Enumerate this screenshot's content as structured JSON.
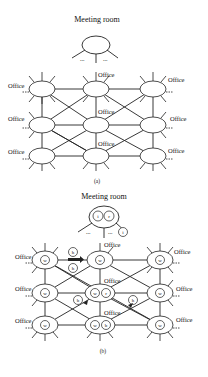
{
  "figure_a": {
    "meeting_room_label": "Meeting room",
    "office_label": "Office",
    "dots": "...",
    "caption": "(a)"
  },
  "figure_b": {
    "meeting_room_label": "Meeting room",
    "office_label": "Office",
    "dots": "...",
    "caption": "(b)",
    "meeting_tokens": [
      "i",
      "r"
    ],
    "meeting_outside_token": "i",
    "office_tokens": {
      "r0c0": [
        "w"
      ],
      "r0c1": [
        "w"
      ],
      "r0c2": [
        "w"
      ],
      "r1c0": [
        "w"
      ],
      "r1c1": [
        "w",
        "r"
      ],
      "r1c2": [
        "w"
      ],
      "r2c0": [
        "w"
      ],
      "r2c1": [
        "w",
        "b"
      ],
      "r2c2": [
        "w"
      ]
    },
    "moving_tokens": [
      "h",
      "h",
      "b",
      "h"
    ]
  },
  "colors": {
    "stroke": "#222222",
    "background": "#ffffff"
  }
}
